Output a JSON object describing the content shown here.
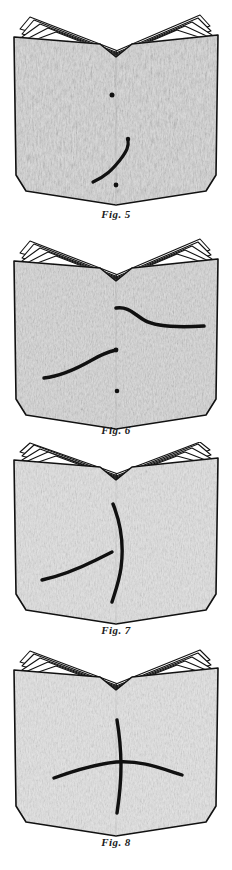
{
  "plate": {
    "width": 232,
    "height": 870,
    "background_color": "#ffffff",
    "ink_color": "#111111",
    "paper_fill_color": "#d8d8d8",
    "paper_highlight_color": "#f2f2f2",
    "description": "Four stacked line-engraving illustrations of an open book, each page spread bearing hand-drawn ink curves and dots."
  },
  "figures": [
    {
      "id": "fig-5",
      "caption": "Fig. 5",
      "subject": "open-book",
      "page_leaf_count": 5,
      "marks": [
        {
          "type": "dot",
          "name": "upper-dot"
        },
        {
          "type": "dot",
          "name": "lower-dot"
        },
        {
          "type": "curve",
          "name": "s-curve-lower-left"
        }
      ]
    },
    {
      "id": "fig-6",
      "caption": "Fig. 6",
      "subject": "open-book",
      "page_leaf_count": 5,
      "marks": [
        {
          "type": "curve",
          "name": "s-curve-upper-right"
        },
        {
          "type": "curve",
          "name": "s-curve-lower-left"
        },
        {
          "type": "dot",
          "name": "lower-dot"
        }
      ]
    },
    {
      "id": "fig-7",
      "caption": "Fig. 7",
      "subject": "open-book",
      "page_leaf_count": 5,
      "marks": [
        {
          "type": "curve",
          "name": "vertical-curve-center"
        },
        {
          "type": "curve",
          "name": "diagonal-curve-left"
        }
      ]
    },
    {
      "id": "fig-8",
      "caption": "Fig. 8",
      "subject": "open-book",
      "page_leaf_count": 5,
      "marks": [
        {
          "type": "curve",
          "name": "vertical-curve-center"
        },
        {
          "type": "curve",
          "name": "horizontal-curve-crossing"
        }
      ]
    }
  ]
}
